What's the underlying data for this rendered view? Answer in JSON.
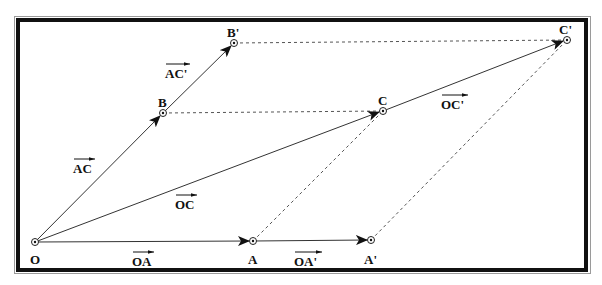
{
  "diagram": {
    "type": "vector-parallelogram",
    "points": {
      "O": {
        "label": "O",
        "x": 35,
        "y": 242
      },
      "A": {
        "label": "A",
        "x": 253,
        "y": 241
      },
      "A2": {
        "label": "A'",
        "x": 371,
        "y": 240
      },
      "B": {
        "label": "B",
        "x": 163,
        "y": 113
      },
      "B2": {
        "label": "B'",
        "x": 234,
        "y": 43
      },
      "C": {
        "label": "C",
        "x": 383,
        "y": 111
      },
      "C2": {
        "label": "C'",
        "x": 567,
        "y": 40
      }
    },
    "vector_labels": {
      "OA": "OA",
      "OA2": "OA'",
      "AC": "AC",
      "AC2": "AC'",
      "OC": "OC",
      "OC2": "OC'"
    }
  }
}
